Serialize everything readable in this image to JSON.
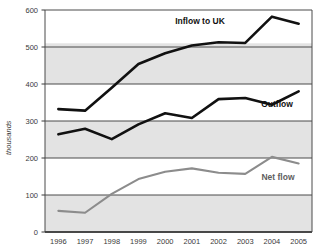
{
  "chart_data": {
    "type": "line",
    "title": "",
    "xlabel": "",
    "ylabel": "thousands",
    "categories": [
      "1996",
      "1997",
      "1998",
      "1999",
      "2000",
      "2001",
      "2002",
      "2003",
      "2004",
      "2005"
    ],
    "ylim": [
      0,
      600
    ],
    "y_ticks": [
      "0",
      "100",
      "200",
      "300",
      "400",
      "500",
      "600"
    ],
    "grid": "horizontal",
    "legend": "inline-annotations",
    "series": [
      {
        "name": "Inflow to UK",
        "color": "#111111",
        "values": [
          332,
          328,
          390,
          454,
          483,
          504,
          513,
          511,
          582,
          563
        ]
      },
      {
        "name": "Outflow",
        "color": "#111111",
        "values": [
          264,
          279,
          251,
          291,
          321,
          308,
          359,
          362,
          344,
          380
        ]
      },
      {
        "name": "Net flow",
        "color": "#8c8c8c",
        "values": [
          57,
          52,
          103,
          143,
          163,
          172,
          160,
          157,
          203,
          185
        ]
      }
    ],
    "annotations": [
      {
        "text": "Inflow to UK",
        "series": "Inflow to UK",
        "x": 200,
        "y": 24
      },
      {
        "text": "Outflow",
        "series": "Outflow",
        "x": 277,
        "y": 107
      },
      {
        "text": "Net flow",
        "series": "Net flow",
        "x": 278,
        "y": 180
      }
    ]
  },
  "plot_area": {
    "left": 45,
    "right": 312,
    "top": 10,
    "bottom": 232,
    "background": "#e3e3e3",
    "gridline_color": "#4a4a4a",
    "border_color": "#4a4a4a"
  }
}
